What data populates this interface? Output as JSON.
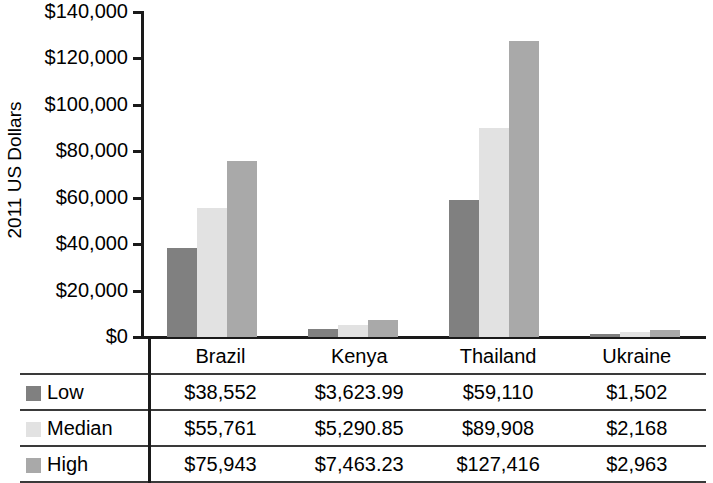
{
  "chart_data": {
    "type": "bar",
    "title": "",
    "xlabel": "",
    "ylabel": "2011 US Dollars",
    "categories": [
      "Brazil",
      "Kenya",
      "Thailand",
      "Ukraine"
    ],
    "series": [
      {
        "name": "Low",
        "color": "#808080",
        "values": [
          38552,
          3623.99,
          59110,
          1502
        ],
        "labels": [
          "$38,552",
          "$3,623.99",
          "$59,110",
          "$1,502"
        ]
      },
      {
        "name": "Median",
        "color": "#e2e2e2",
        "values": [
          55761,
          5290.85,
          89908,
          2168
        ],
        "labels": [
          "$55,761",
          "$5,290.85",
          "$89,908",
          "$2,168"
        ]
      },
      {
        "name": "High",
        "color": "#a9a9a9",
        "values": [
          75943,
          7463.23,
          127416,
          2963
        ],
        "labels": [
          "$75,943",
          "$7,463.23",
          "$127,416",
          "$2,963"
        ]
      }
    ],
    "ylim": [
      0,
      140000
    ],
    "ytick_values": [
      0,
      20000,
      40000,
      60000,
      80000,
      100000,
      120000,
      140000
    ],
    "ytick_labels": [
      "$0",
      "$20,000",
      "$40,000",
      "$60,000",
      "$80,000",
      "$100,000",
      "$120,000",
      "$140,000"
    ],
    "grid": false,
    "legend_position": "table-left-column"
  },
  "axis": {
    "y_title": "2011 US Dollars"
  },
  "table": {
    "header_blank": "",
    "column_headers": [
      "Brazil",
      "Kenya",
      "Thailand",
      "Ukraine"
    ],
    "rows": [
      {
        "label": "Low",
        "swatch_color": "#808080",
        "cells": [
          "$38,552",
          "$3,623.99",
          "$59,110",
          "$1,502"
        ]
      },
      {
        "label": "Median",
        "swatch_color": "#e2e2e2",
        "cells": [
          "$55,761",
          "$5,290.85",
          "$89,908",
          "$2,168"
        ]
      },
      {
        "label": "High",
        "swatch_color": "#a9a9a9",
        "cells": [
          "$75,943",
          "$7,463.23",
          "$127,416",
          "$2,963"
        ]
      }
    ]
  }
}
